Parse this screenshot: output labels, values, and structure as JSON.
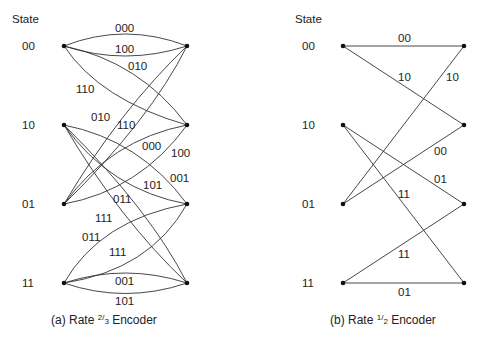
{
  "diagram_a": {
    "state_header": "State",
    "states": [
      "00",
      "10",
      "01",
      "11"
    ],
    "caption_prefix": "(a) Rate ",
    "caption_num": "2",
    "caption_den": "3",
    "caption_suffix": " Encoder",
    "edges": [
      {
        "from": "00",
        "to": "00",
        "label": "000"
      },
      {
        "from": "00",
        "to": "00",
        "label": "100"
      },
      {
        "from": "00",
        "to": "10",
        "label": "010"
      },
      {
        "from": "00",
        "to": "10",
        "label": "110"
      },
      {
        "from": "10",
        "to": "01",
        "label": "101"
      },
      {
        "from": "10",
        "to": "01",
        "label": "001"
      },
      {
        "from": "10",
        "to": "11",
        "label": "011"
      },
      {
        "from": "10",
        "to": "11",
        "label": "111"
      },
      {
        "from": "01",
        "to": "00",
        "label": "010"
      },
      {
        "from": "01",
        "to": "00",
        "label": "110"
      },
      {
        "from": "01",
        "to": "10",
        "label": "000"
      },
      {
        "from": "01",
        "to": "10",
        "label": "100"
      },
      {
        "from": "11",
        "to": "01",
        "label": "011"
      },
      {
        "from": "11",
        "to": "01",
        "label": "111"
      },
      {
        "from": "11",
        "to": "11",
        "label": "001"
      },
      {
        "from": "11",
        "to": "11",
        "label": "101"
      }
    ]
  },
  "diagram_b": {
    "state_header": "State",
    "states": [
      "00",
      "10",
      "01",
      "11"
    ],
    "caption_prefix": "(b) Rate ",
    "caption_num": "1",
    "caption_den": "2",
    "caption_suffix": " Encoder",
    "edges": [
      {
        "from": "00",
        "to": "00",
        "label": "00"
      },
      {
        "from": "00",
        "to": "10",
        "label": "10"
      },
      {
        "from": "01",
        "to": "00",
        "label": "10"
      },
      {
        "from": "01",
        "to": "10",
        "label": "00"
      },
      {
        "from": "10",
        "to": "01",
        "label": "01"
      },
      {
        "from": "10",
        "to": "11",
        "label": "11"
      },
      {
        "from": "11",
        "to": "01",
        "label": "11"
      },
      {
        "from": "11",
        "to": "11",
        "label": "01"
      }
    ]
  }
}
